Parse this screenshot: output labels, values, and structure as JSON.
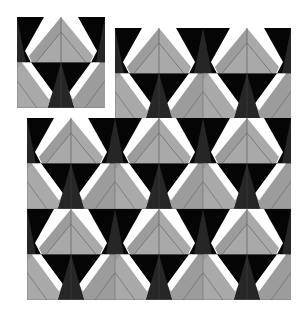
{
  "image": {
    "width": 307,
    "height": 319,
    "background": "#ffffff",
    "description": "Tessellation pattern of chevron / arrow tiles in black, white, gray and dark gray"
  },
  "colors": {
    "black": "#050505",
    "white": "#ffffff",
    "gray": "#a9a9a9",
    "gray_shade": "#9c9c9c",
    "dark": "#262626",
    "line": "#6e6e6e"
  },
  "tile": {
    "width": 88,
    "height": 45.5
  },
  "panels": [
    {
      "name": "small-panel",
      "x": 17,
      "y": 17,
      "cols": 1,
      "rows": 2
    },
    {
      "name": "upper-panel",
      "x": 115,
      "y": 28,
      "cols": 2,
      "rows": 2
    },
    {
      "name": "lower-panel",
      "x": 27,
      "y": 118,
      "cols": 3,
      "rows": 4
    }
  ]
}
